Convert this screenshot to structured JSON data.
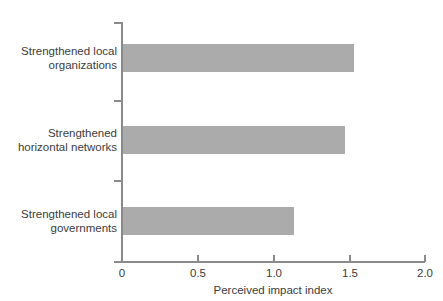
{
  "chart_data": {
    "type": "bar",
    "orientation": "horizontal",
    "title": "",
    "subtitle": "",
    "xlabel": "Perceived impact index",
    "ylabel": "",
    "categories": [
      "Strengthened local\norganizations",
      "Strengthened\nhorizontal networks",
      "Strengthened local\ngovernments"
    ],
    "values": [
      1.53,
      1.47,
      1.13
    ],
    "xlim": [
      0,
      2.0
    ],
    "xticks": [
      0,
      0.5,
      1.0,
      1.5,
      2.0
    ],
    "xtick_labels": [
      "0",
      "0.5",
      "1.0",
      "1.5",
      "2.0"
    ],
    "grid": false,
    "legend": false,
    "bar_color": "#ababab",
    "axis_color": "#8a8a8a",
    "text_color": "#3c3c3c"
  },
  "axis": {
    "x_title": "Perceived impact index",
    "tick_labels": [
      "0",
      "0.5",
      "1.0",
      "1.5",
      "2.0"
    ]
  },
  "bars": [
    {
      "label": "Strengthened local\norganizations",
      "value": 1.53
    },
    {
      "label": "Strengthened\nhorizontal networks",
      "value": 1.47
    },
    {
      "label": "Strengthened local\ngovernments",
      "value": 1.13
    }
  ]
}
